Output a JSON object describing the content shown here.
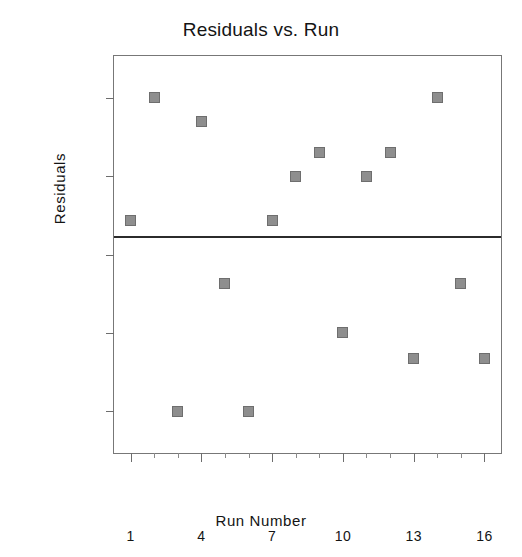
{
  "chart_data": {
    "type": "scatter",
    "title": "Residuals vs. Run",
    "xlabel": "Run Number",
    "ylabel": "Residuals",
    "x": [
      1,
      2,
      3,
      4,
      5,
      6,
      7,
      8,
      9,
      10,
      11,
      12,
      13,
      14,
      15,
      16
    ],
    "values": [
      0.2,
      1.375,
      -1.625,
      1.15,
      -0.4,
      -1.625,
      0.2,
      0.625,
      0.85,
      -0.875,
      0.625,
      0.85,
      -1.125,
      1.375,
      -0.4,
      -1.125
    ],
    "series": [
      {
        "name": "Residuals",
        "points": [
          {
            "x": 1,
            "y": 0.2
          },
          {
            "x": 2,
            "y": 1.375
          },
          {
            "x": 3,
            "y": -1.625
          },
          {
            "x": 4,
            "y": 1.15
          },
          {
            "x": 5,
            "y": -0.4
          },
          {
            "x": 6,
            "y": -1.625
          },
          {
            "x": 7,
            "y": 0.2
          },
          {
            "x": 8,
            "y": 0.625
          },
          {
            "x": 9,
            "y": 0.85
          },
          {
            "x": 10,
            "y": -0.875
          },
          {
            "x": 11,
            "y": 0.625
          },
          {
            "x": 12,
            "y": 0.85
          },
          {
            "x": 13,
            "y": -1.125
          },
          {
            "x": 14,
            "y": 1.375
          },
          {
            "x": 15,
            "y": -0.4
          },
          {
            "x": 16,
            "y": -1.125
          }
        ]
      }
    ],
    "xlim": [
      0.3,
      16.7
    ],
    "ylim": [
      -2.025,
      1.775
    ],
    "xticks": [
      1,
      4,
      7,
      10,
      13,
      16
    ],
    "xtick_labels": [
      "1",
      "4",
      "7",
      "10",
      "13",
      "16"
    ],
    "xticks_minor": [
      2,
      3,
      5,
      6,
      8,
      9,
      11,
      12,
      14,
      15
    ],
    "yticks": [
      1.375,
      0.625,
      -0.125,
      -0.875,
      -1.625
    ],
    "ytick_labels": [
      "1.375",
      "0.625",
      "-0.125",
      "-0.875",
      "-1.625"
    ],
    "grid": false,
    "legend": null,
    "reference_line": {
      "y": 0.05,
      "orientation": "horizontal",
      "color": "#2b2b2b"
    },
    "marker": {
      "shape": "square",
      "fill": "#8e8e8e",
      "edge": "#6e6e6e",
      "size": 11
    }
  },
  "colors": {
    "background": "#ffffff",
    "frame": "#777777",
    "text": "#141414",
    "marker_fill": "#8e8e8e",
    "marker_edge": "#6e6e6e",
    "reference_line": "#2b2b2b"
  }
}
